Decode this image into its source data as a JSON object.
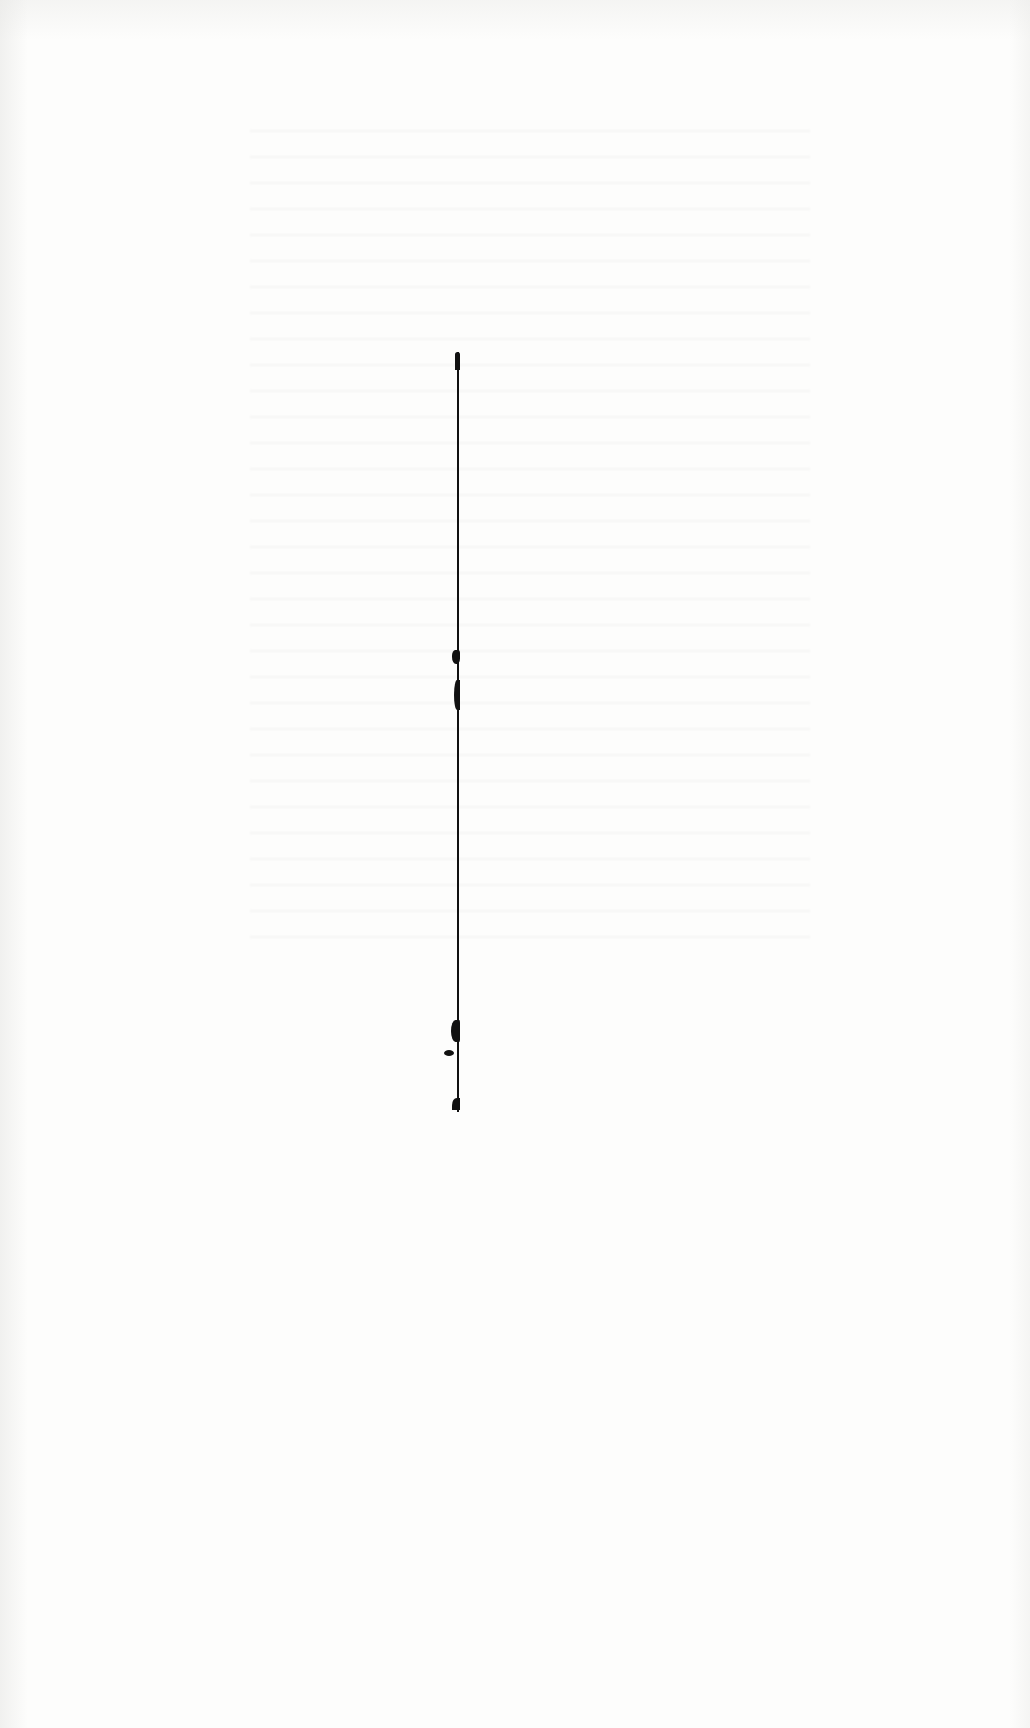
{
  "document": {
    "type": "scanned-blank-page",
    "text_content": [],
    "marks": [
      {
        "kind": "vertical-rule",
        "description": "thin black vertical line with ink blots"
      }
    ],
    "colors": {
      "paper": "#fdfdfc",
      "ink": "#111111"
    }
  }
}
